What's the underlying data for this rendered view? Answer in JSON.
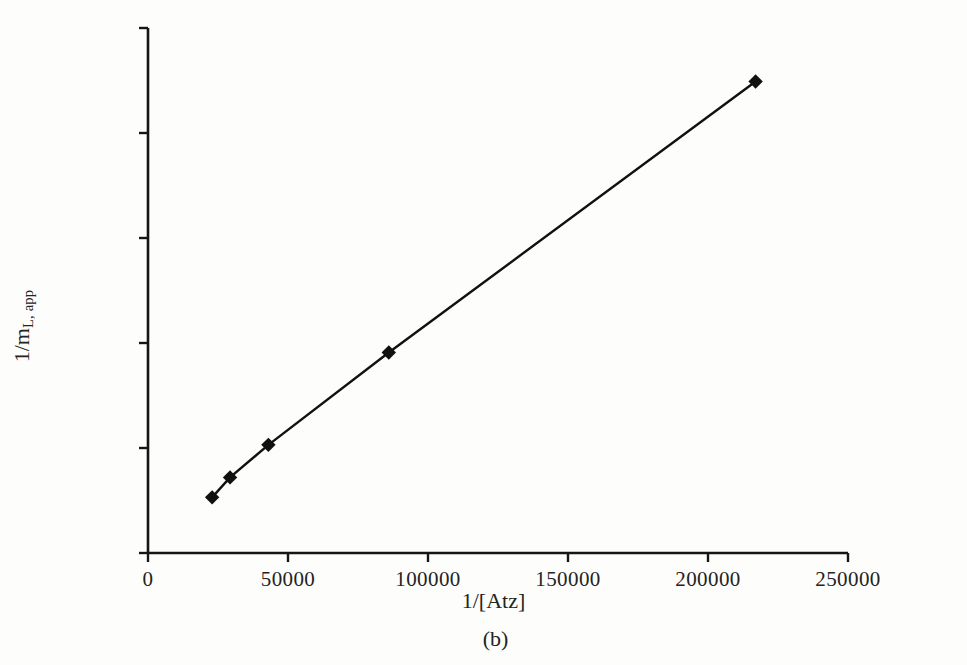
{
  "figure": {
    "caption": "(b)",
    "background_color": "#fdfdfb",
    "ink_color": "#1a1a1a"
  },
  "chart_data": {
    "type": "line",
    "title": "",
    "subtitle": "",
    "xlabel": "1/[Atz]",
    "ylabel_main": "1/m",
    "ylabel_subscript": "L, app",
    "ylabel_full": "1/m L, app",
    "xlim": [
      0,
      250000
    ],
    "ylim": [
      0,
      250000000
    ],
    "grid": false,
    "legend": false,
    "legend_position": "none",
    "marker": "diamond",
    "marker_color": "#111111",
    "line_color": "#111111",
    "xtick_labels": [
      "0",
      "50000",
      "100000",
      "150000",
      "200000",
      "250000"
    ],
    "xtick_values": [
      0,
      50000,
      100000,
      150000,
      200000,
      250000
    ],
    "ytick_labels": [
      "0.0E + 00",
      "5.0E + 07",
      "1.0E + 08",
      "1.5E + 08",
      "2.0E + 08",
      "2.5E + 08"
    ],
    "ytick_values": [
      0,
      50000000,
      100000000,
      150000000,
      200000000,
      250000000
    ],
    "series": [
      {
        "name": "1/m_L,app vs 1/[Atz]",
        "points": [
          {
            "x": 22900,
            "y": 26500000
          },
          {
            "x": 29300,
            "y": 36000000
          },
          {
            "x": 43000,
            "y": 51500000
          },
          {
            "x": 86000,
            "y": 95500000
          },
          {
            "x": 217000,
            "y": 224500000
          }
        ]
      }
    ]
  },
  "axes": {
    "geometry": {
      "x0_px": 148,
      "y0_px": 553,
      "x_max_px": 848,
      "y_max_px": 28
    }
  }
}
